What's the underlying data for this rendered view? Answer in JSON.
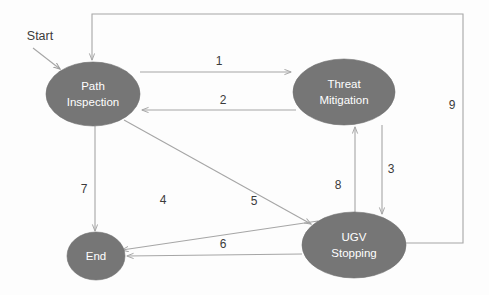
{
  "diagram": {
    "background_color": "#fdfdfd",
    "node_fill_color": "#767676",
    "node_text_color": "#ffffff",
    "edge_color": "#a6a6a6",
    "label_color": "#3b3b3b",
    "start_label": "Start",
    "nodes": [
      {
        "id": "path-inspection",
        "label_line1": "Path",
        "label_line2": "Inspection",
        "shape": "ellipse",
        "cx": 93,
        "cy": 94,
        "rx": 47,
        "ry": 32
      },
      {
        "id": "threat-mitigation",
        "label_line1": "Threat",
        "label_line2": "Mitigation",
        "shape": "ellipse",
        "cx": 344,
        "cy": 92,
        "rx": 51,
        "ry": 33
      },
      {
        "id": "ugv-stopping",
        "label_line1": "UGV",
        "label_line2": "Stopping",
        "shape": "ellipse",
        "cx": 354,
        "cy": 245,
        "rx": 52,
        "ry": 33
      },
      {
        "id": "end",
        "label_line1": "End",
        "label_line2": "",
        "shape": "circle",
        "cx": 96,
        "cy": 256,
        "rx": 29,
        "ry": 24
      }
    ],
    "edges": [
      {
        "id": "edge-1",
        "label": "1",
        "from": "path-inspection",
        "to": "threat-mitigation",
        "label_x": 219,
        "label_y": 62
      },
      {
        "id": "edge-2",
        "label": "2",
        "from": "threat-mitigation",
        "to": "path-inspection",
        "label_x": 223,
        "label_y": 101
      },
      {
        "id": "edge-3",
        "label": "3",
        "from": "threat-mitigation",
        "to": "ugv-stopping",
        "label_x": 391,
        "label_y": 170
      },
      {
        "id": "edge-4",
        "label": "4",
        "from": "ugv-stopping",
        "to": "end",
        "label_x": 163,
        "label_y": 201
      },
      {
        "id": "edge-5",
        "label": "5",
        "from": "path-inspection",
        "to": "ugv-stopping",
        "label_x": 254,
        "label_y": 202
      },
      {
        "id": "edge-6",
        "label": "6",
        "from": "ugv-stopping",
        "to": "end",
        "label_x": 223,
        "label_y": 245
      },
      {
        "id": "edge-7",
        "label": "7",
        "from": "path-inspection",
        "to": "end",
        "label_x": 84,
        "label_y": 190
      },
      {
        "id": "edge-8",
        "label": "8",
        "from": "ugv-stopping",
        "to": "threat-mitigation",
        "label_x": 338,
        "label_y": 186
      },
      {
        "id": "edge-9",
        "label": "9",
        "from": "ugv-stopping",
        "to": "path-inspection",
        "label_x": 452,
        "label_y": 106
      }
    ]
  }
}
